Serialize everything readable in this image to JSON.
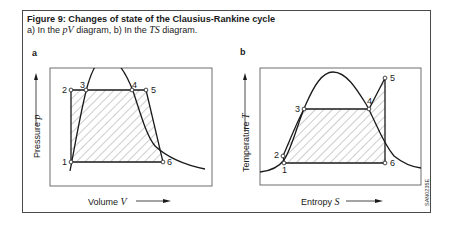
{
  "figure": {
    "title": "Figure 9: Changes of state of the Clausius-Rankine cycle",
    "subtitle_prefix": "a) In the ",
    "subtitle_pv": "pV",
    "subtitle_mid": " diagram, b) In the ",
    "subtitle_ts": "TS",
    "subtitle_suffix": " diagram.",
    "code": "SAN0235E"
  },
  "panel_a": {
    "letter": "a",
    "type": "pV diagram",
    "ylabel": "Pressure ",
    "ylabel_var": "p",
    "xlabel": "Volume ",
    "xlabel_var": "V",
    "points": [
      {
        "id": "1",
        "label": "1"
      },
      {
        "id": "2",
        "label": "2"
      },
      {
        "id": "3",
        "label": "3"
      },
      {
        "id": "4",
        "label": "4"
      },
      {
        "id": "5",
        "label": "5"
      },
      {
        "id": "6",
        "label": "6"
      }
    ]
  },
  "panel_b": {
    "letter": "b",
    "type": "TS diagram",
    "ylabel": "Temperature ",
    "ylabel_var": "T",
    "xlabel": "Entropy ",
    "xlabel_var": "S",
    "points": [
      {
        "id": "1",
        "label": "1"
      },
      {
        "id": "2",
        "label": "2"
      },
      {
        "id": "3",
        "label": "3"
      },
      {
        "id": "4",
        "label": "4"
      },
      {
        "id": "5",
        "label": "5"
      },
      {
        "id": "6",
        "label": "6"
      }
    ]
  },
  "colors": {
    "line": "#1a1a1a",
    "frame": "#4a4a4a",
    "hatch": "#555555",
    "background": "#ffffff"
  }
}
